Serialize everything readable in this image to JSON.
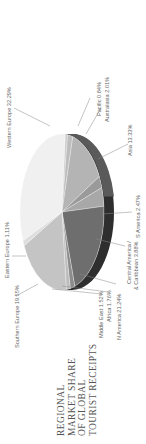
{
  "title_lines": [
    "REGIONAL",
    "MARKET SHARE",
    "OF GLOBAL",
    "TOURIST RECEIPTS"
  ],
  "chart_data": {
    "type": "pie",
    "title": "Regional Market Share of Global Tourist Receipts",
    "style": "3d-pie, rotated 90deg counter-clockwise",
    "categories": [
      "Western Europe",
      "Pacific",
      "Australasia",
      "Asia",
      "S America",
      "Central America & Caribbean",
      "N America",
      "Africa",
      "Middle East",
      "Southern Europe",
      "Eastern Europe"
    ],
    "values": [
      32.29,
      0.84,
      2.01,
      13.33,
      2.47,
      3.88,
      21.24,
      1.76,
      1.52,
      19.55,
      1.11
    ],
    "unit": "%"
  },
  "labels": {
    "western_europe": "Western Europe 32.29%",
    "pacific": "Pacific 0.84%",
    "australasia": "Australasia 2.01%",
    "asia": "Asia 13.33%",
    "s_america": "S America 2.47%",
    "central_america_1": "Central America /",
    "central_america_2": "& Caribbean 3.88%",
    "n_america": "N America 21.24%",
    "africa": "Africa 1.76%",
    "middle_east": "Middle East 1.52%",
    "southern_europe": "Southern Europe 19.55%",
    "eastern_europe": "Eastern Europe 1.11%"
  },
  "colors": {
    "western_europe": "#f0f0f0",
    "pacific": "#c8c8c8",
    "australasia": "#bdbdbd",
    "asia": "#b4b4b4",
    "s_america": "#9a9a9a",
    "central_america": "#a8a8a8",
    "n_america": "#6e6e6e",
    "africa": "#8c8c8c",
    "middle_east": "#bcbcbc",
    "southern_europe": "#c4c4c4",
    "eastern_europe": "#dedede",
    "rim_dark": "#2e2e2e",
    "rim_mid": "#5a5a5a"
  }
}
